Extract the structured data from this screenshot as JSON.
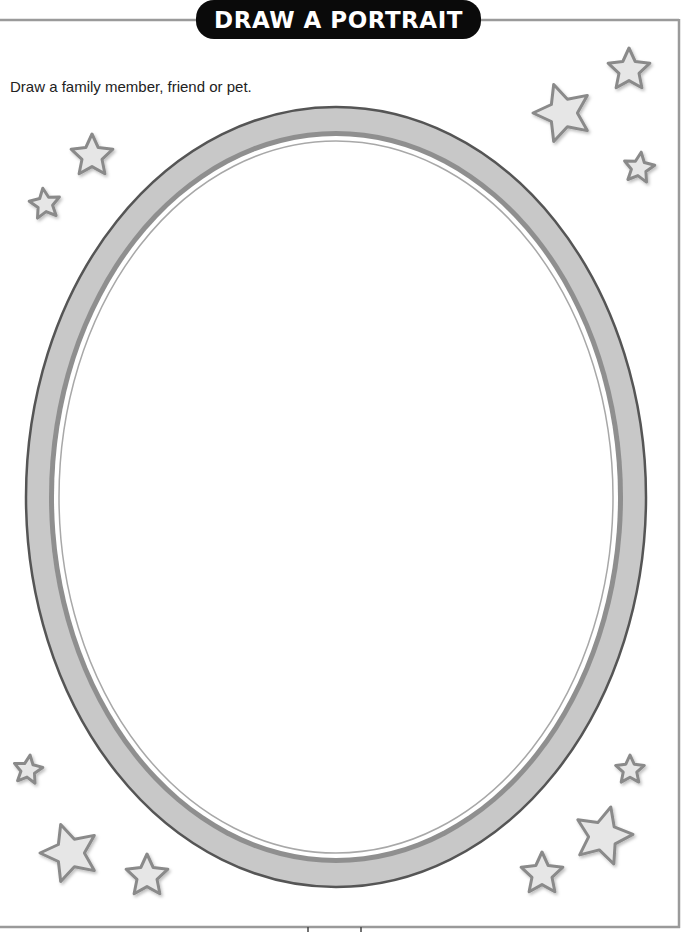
{
  "title": "DRAW A PORTRAIT",
  "instruction": "Draw a family member, friend or pet.",
  "colors": {
    "border_line": "#9a9a9a",
    "badge_bg": "#0a0a0a",
    "badge_text": "#ffffff",
    "frame_outer_edge": "#555555",
    "frame_band_light": "#c8c8c8",
    "frame_band_dark": "#8f8f8f",
    "frame_inner_line": "#a8a8a8",
    "star_fill": "#e6e6e6",
    "star_stroke": "#8a8a8a"
  },
  "frame": {
    "shape": "oval",
    "icon": "portrait-frame"
  },
  "stars": [
    {
      "name": "star-top-right-1"
    },
    {
      "name": "star-top-right-2"
    },
    {
      "name": "star-top-right-3"
    },
    {
      "name": "star-top-left-1"
    },
    {
      "name": "star-top-left-2"
    },
    {
      "name": "star-bottom-left-1"
    },
    {
      "name": "star-bottom-left-2"
    },
    {
      "name": "star-bottom-left-3"
    },
    {
      "name": "star-bottom-right-1"
    },
    {
      "name": "star-bottom-right-2"
    },
    {
      "name": "star-bottom-right-3"
    }
  ]
}
